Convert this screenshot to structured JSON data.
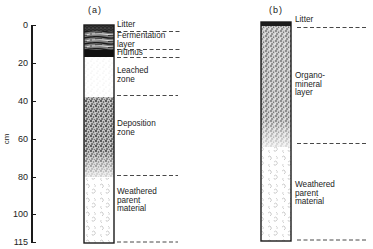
{
  "figure": {
    "panels": [
      {
        "id": "a",
        "label": "(a)",
        "layers": [
          {
            "name": "Litter",
            "top_cm": 0,
            "bottom_cm": 3
          },
          {
            "name": "Fermentation layer",
            "top_cm": 3,
            "bottom_cm": 13
          },
          {
            "name": "Humus",
            "top_cm": 13,
            "bottom_cm": 17
          },
          {
            "name": "Leached zone",
            "top_cm": 17,
            "bottom_cm": 38
          },
          {
            "name": "Deposition zone",
            "top_cm": 38,
            "bottom_cm": 80
          },
          {
            "name": "Weathered parent material",
            "top_cm": 80,
            "bottom_cm": 115
          }
        ],
        "labels": {
          "litter": "Litter",
          "fermentation_1": "Fermentation",
          "fermentation_2": "layer",
          "humus": "Humus",
          "leached_1": "Leached",
          "leached_2": "zone",
          "deposition_1": "Deposition",
          "deposition_2": "zone",
          "weathered_1": "Weathered",
          "weathered_2": "parent",
          "weathered_3": "material"
        }
      },
      {
        "id": "b",
        "label": "(b)",
        "layers": [
          {
            "name": "Litter",
            "top_cm": 0,
            "bottom_cm": 2
          },
          {
            "name": "Organo-mineral layer",
            "top_cm": 2,
            "bottom_cm": 65
          },
          {
            "name": "Weathered parent material",
            "top_cm": 65,
            "bottom_cm": 115
          }
        ],
        "labels": {
          "litter": "Litter",
          "organo_1": "Organo-",
          "organo_2": "mineral",
          "organo_3": "layer",
          "weathered_1": "Weathered",
          "weathered_2": "parent",
          "weathered_3": "material"
        }
      }
    ],
    "axis": {
      "unit_label": "cm",
      "ticks": [
        "0",
        "20",
        "40",
        "60",
        "80",
        "100",
        "115"
      ],
      "range": [
        0,
        115
      ]
    },
    "colors": {
      "ink": "#1a1a1a",
      "background": "#ffffff",
      "dashed": "#333333"
    }
  }
}
